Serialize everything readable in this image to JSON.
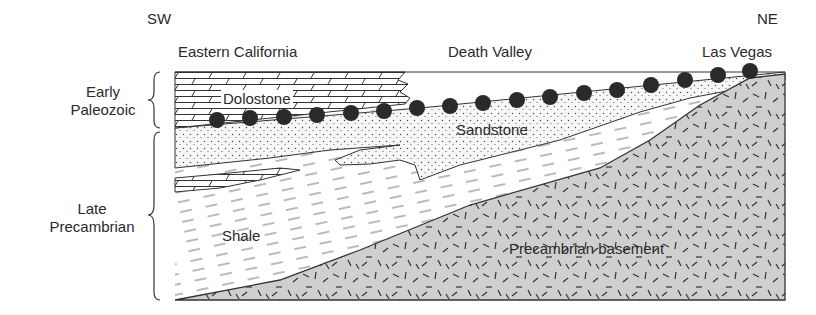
{
  "directions": {
    "left": "SW",
    "right": "NE"
  },
  "locations": [
    {
      "label": "Eastern California"
    },
    {
      "label": "Death Valley"
    },
    {
      "label": "Las Vegas"
    }
  ],
  "age_brackets": [
    {
      "line1": "Early",
      "line2": "Paleozoic"
    },
    {
      "line1": "Late",
      "line2": "Precambrian"
    }
  ],
  "units": {
    "dolostone": "Dolostone",
    "sandstone": "Sandstone",
    "shale": "Shale",
    "basement": "Precambrian basement"
  },
  "colors": {
    "ink": "#2a2a2a",
    "basement_fill": "#cfcfcf",
    "background": "#ffffff"
  }
}
